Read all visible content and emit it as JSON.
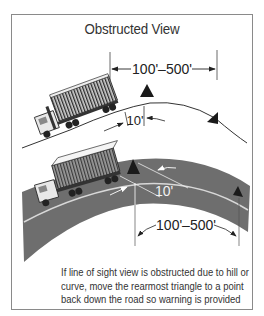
{
  "title": "Obstructed View",
  "scene_top": {
    "description": "Truck climbing a hill crest",
    "distance_label": "100'–500'",
    "offset_label": "10'"
  },
  "scene_bottom": {
    "description": "Truck approaching a curve",
    "offset_label": "10'",
    "distance_label": "100'–500'"
  },
  "caption": {
    "lines": [
      "If line of sight view is obstructed due to hill or",
      "curve, move the rearmost triangle to a point",
      "back down the road so warning is provided"
    ]
  },
  "colors": {
    "road": "#6e6e6e",
    "ink": "#222222",
    "frame": "#8a8a8a",
    "background": "#ffffff"
  }
}
